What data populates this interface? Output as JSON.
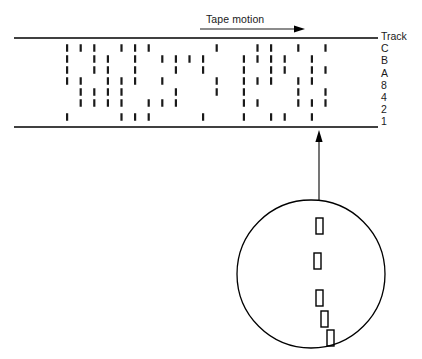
{
  "figure": {
    "title_label": "Tape motion",
    "track_header": "Track",
    "track_names": [
      "C",
      "B",
      "A",
      "8",
      "4",
      "2",
      "1"
    ],
    "line_color": "#000000",
    "mark_color": "#1a1a1a",
    "background": "#ffffff"
  },
  "tape_band": {
    "top_rule_y": 38,
    "bottom_rule_y": 127,
    "left_x": 14,
    "right_x": 378
  },
  "motion_arrow": {
    "x_start": 200,
    "x_end": 305,
    "y": 29,
    "label_x": 206,
    "label_y": 13,
    "direction": "right"
  },
  "track_rows": {
    "row_y": [
      48,
      59,
      70,
      81,
      92,
      103,
      117
    ],
    "mark_width": 2.2,
    "mark_height": 7.5,
    "first_column_x": 66,
    "column_pitch": 13.6,
    "column_count": 20
  },
  "bit_pattern": {
    "description": "Per-track bit columns; 1 = recorded flux mark present",
    "rows": [
      {
        "track": "C",
        "bits": [
          1,
          1,
          1,
          0,
          1,
          1,
          1,
          0,
          0,
          0,
          0,
          1,
          0,
          0,
          1,
          1,
          0,
          1,
          0,
          1
        ]
      },
      {
        "track": "B",
        "bits": [
          1,
          0,
          1,
          1,
          0,
          1,
          0,
          1,
          1,
          1,
          1,
          0,
          0,
          1,
          1,
          1,
          1,
          0,
          1,
          0
        ]
      },
      {
        "track": "A",
        "bits": [
          1,
          0,
          1,
          1,
          0,
          1,
          0,
          0,
          1,
          0,
          1,
          0,
          0,
          1,
          0,
          1,
          1,
          0,
          1,
          1
        ]
      },
      {
        "track": "8",
        "bits": [
          1,
          1,
          0,
          1,
          1,
          1,
          0,
          1,
          0,
          0,
          0,
          1,
          0,
          1,
          1,
          1,
          0,
          1,
          1,
          0
        ]
      },
      {
        "track": "4",
        "bits": [
          0,
          1,
          1,
          1,
          1,
          0,
          0,
          0,
          1,
          0,
          0,
          1,
          0,
          1,
          0,
          0,
          0,
          1,
          0,
          1
        ]
      },
      {
        "track": "2",
        "bits": [
          0,
          1,
          1,
          1,
          1,
          0,
          1,
          1,
          1,
          0,
          0,
          0,
          0,
          1,
          1,
          0,
          0,
          1,
          1,
          1
        ]
      },
      {
        "track": "1",
        "bits": [
          1,
          0,
          0,
          0,
          1,
          1,
          1,
          0,
          0,
          0,
          1,
          0,
          0,
          1,
          0,
          1,
          1,
          0,
          1,
          0
        ]
      }
    ]
  },
  "callout": {
    "circle_cx": 311,
    "circle_cy": 274,
    "circle_r": 74,
    "leader_x": 319,
    "leader_y_top": 130,
    "leader_y_bottom": 200,
    "magnified_marks": [
      {
        "x": 316,
        "y": 218,
        "w": 7,
        "h": 16
      },
      {
        "x": 314,
        "y": 253,
        "w": 7,
        "h": 16
      },
      {
        "x": 316,
        "y": 290,
        "w": 7,
        "h": 16
      },
      {
        "x": 321,
        "y": 311,
        "w": 7,
        "h": 16
      },
      {
        "x": 327,
        "y": 330,
        "w": 7,
        "h": 16
      }
    ]
  }
}
